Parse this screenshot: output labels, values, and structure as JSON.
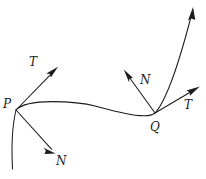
{
  "figure": {
    "type": "geometry-diagram",
    "background_color": "#ffffff",
    "stroke_color": "#1c1c1c",
    "width": 206,
    "height": 179,
    "points": [
      {
        "id": "P",
        "label": "P",
        "label_x": 3,
        "label_y": 98,
        "anchor_x": 16,
        "anchor_y": 110
      },
      {
        "id": "Q",
        "label": "Q",
        "label_x": 150,
        "label_y": 121,
        "anchor_x": 155,
        "anchor_y": 113
      }
    ],
    "vectors": [
      {
        "id": "T-at-P",
        "label": "T",
        "kind": "tangent",
        "label_x": 29,
        "label_y": 56,
        "from_x": 16,
        "from_y": 110,
        "to_x": 57,
        "to_y": 68
      },
      {
        "id": "N-at-P",
        "label": "N",
        "kind": "normal",
        "label_x": 56,
        "label_y": 155,
        "from_x": 16,
        "from_y": 110,
        "to_x": 55,
        "to_y": 153
      },
      {
        "id": "N-at-Q",
        "label": "N",
        "kind": "normal",
        "label_x": 140,
        "label_y": 74,
        "from_x": 155,
        "from_y": 113,
        "to_x": 124,
        "to_y": 70
      },
      {
        "id": "T-at-Q",
        "label": "T",
        "kind": "tangent",
        "label_x": 184,
        "label_y": 99,
        "from_x": 155,
        "from_y": 113,
        "to_x": 199,
        "to_y": 87
      }
    ],
    "curve": {
      "id": "main-curve",
      "has_terminal_arrow": true,
      "arrow_tip_x": 193,
      "arrow_tip_y": 8,
      "tail_x": 12,
      "tail_y": 169
    }
  }
}
